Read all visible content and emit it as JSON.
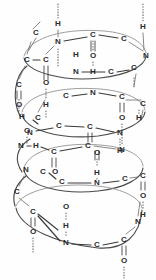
{
  "figure": {
    "kind": "molecular-structure-diagram",
    "background_color": "#fefefe",
    "ink_color": "#2b2b2b",
    "coil_color": "#4a4a4a",
    "hbond_color": "#5a5a5a",
    "turns": 3,
    "atom_labels": {
      "nitrogen": "N",
      "carbon": "C",
      "oxygen": "O",
      "hydrogen": "H"
    },
    "turn1": {
      "atoms": [
        {
          "id": "t1-c-ext",
          "label": "C",
          "x": 36,
          "y": 33
        },
        {
          "id": "t1-n1",
          "label": "N",
          "x": 58,
          "y": 42
        },
        {
          "id": "t1-h1",
          "label": "H",
          "x": 58,
          "y": 24
        },
        {
          "id": "t1-c1",
          "label": "C",
          "x": 93,
          "y": 35
        },
        {
          "id": "t1-c2",
          "label": "C",
          "x": 124,
          "y": 39
        },
        {
          "id": "t1-h2",
          "label": "H",
          "x": 143,
          "y": 27
        },
        {
          "id": "t1-n2",
          "label": "N",
          "x": 146,
          "y": 56
        },
        {
          "id": "t1-o1",
          "label": "O",
          "x": 93,
          "y": 56
        },
        {
          "id": "t1-h3",
          "label": "H",
          "x": 76,
          "y": 55
        },
        {
          "id": "t1-ca",
          "label": "C",
          "x": 27,
          "y": 60
        },
        {
          "id": "t1-cb",
          "label": "C",
          "x": 46,
          "y": 60
        },
        {
          "id": "t1-n3",
          "label": "N",
          "x": 76,
          "y": 72
        },
        {
          "id": "t1-h4",
          "label": "H",
          "x": 93,
          "y": 72
        },
        {
          "id": "t1-c3",
          "label": "C",
          "x": 111,
          "y": 72
        },
        {
          "id": "t1-c4",
          "label": "C",
          "x": 134,
          "y": 68
        }
      ]
    },
    "turn2": {
      "atoms": [
        {
          "id": "t2-c-ext",
          "label": "C",
          "x": 19,
          "y": 85
        },
        {
          "id": "t2-o-ext",
          "label": "O",
          "x": 19,
          "y": 105
        },
        {
          "id": "t2-o1",
          "label": "O",
          "x": 46,
          "y": 83
        },
        {
          "id": "t2-h1",
          "label": "H",
          "x": 46,
          "y": 105
        },
        {
          "id": "t2-c1",
          "label": "C",
          "x": 66,
          "y": 96
        },
        {
          "id": "t2-n1",
          "label": "N",
          "x": 93,
          "y": 93
        },
        {
          "id": "t2-c2",
          "label": "C",
          "x": 122,
          "y": 97
        },
        {
          "id": "t2-o2",
          "label": "O",
          "x": 122,
          "y": 118
        },
        {
          "id": "t2-h2",
          "label": "H",
          "x": 139,
          "y": 118
        },
        {
          "id": "t2-c3",
          "label": "C",
          "x": 143,
          "y": 104
        },
        {
          "id": "t2-ca",
          "label": "C",
          "x": 38,
          "y": 118
        },
        {
          "id": "t2-o3",
          "label": "O",
          "x": 27,
          "y": 131
        },
        {
          "id": "t2-h3",
          "label": "H",
          "x": 22,
          "y": 117
        },
        {
          "id": "t2-n2",
          "label": "N",
          "x": 30,
          "y": 133
        },
        {
          "id": "t2-c4",
          "label": "C",
          "x": 59,
          "y": 126
        },
        {
          "id": "t2-c5",
          "label": "C",
          "x": 90,
          "y": 127
        },
        {
          "id": "t2-n3",
          "label": "N",
          "x": 120,
          "y": 133
        },
        {
          "id": "t2-h4",
          "label": "H",
          "x": 120,
          "y": 151
        }
      ]
    },
    "turn3": {
      "atoms": [
        {
          "id": "t3-n1",
          "label": "N",
          "x": 21,
          "y": 146
        },
        {
          "id": "t3-h1",
          "label": "H",
          "x": 36,
          "y": 146
        },
        {
          "id": "t3-c1",
          "label": "C",
          "x": 54,
          "y": 152
        },
        {
          "id": "t3-c2",
          "label": "C",
          "x": 88,
          "y": 146
        },
        {
          "id": "t3-o1",
          "label": "O",
          "x": 97,
          "y": 153
        },
        {
          "id": "t3-n2",
          "label": "N",
          "x": 122,
          "y": 150
        },
        {
          "id": "t3-n3",
          "label": "N",
          "x": 26,
          "y": 170
        },
        {
          "id": "t3-c3",
          "label": "C",
          "x": 43,
          "y": 172
        },
        {
          "id": "t3-o2",
          "label": "O",
          "x": 55,
          "y": 172
        },
        {
          "id": "t3-h2",
          "label": "H",
          "x": 97,
          "y": 173
        },
        {
          "id": "t3-c4",
          "label": "C",
          "x": 62,
          "y": 182
        },
        {
          "id": "t3-n4",
          "label": "N",
          "x": 97,
          "y": 183
        },
        {
          "id": "t3-c5",
          "label": "C",
          "x": 125,
          "y": 179
        },
        {
          "id": "t3-c6",
          "label": "C",
          "x": 143,
          "y": 176
        },
        {
          "id": "t3-o3",
          "label": "O",
          "x": 143,
          "y": 196
        },
        {
          "id": "t3-h3",
          "label": "H",
          "x": 143,
          "y": 215
        },
        {
          "id": "t3-ca",
          "label": "C",
          "x": 17,
          "y": 192
        },
        {
          "id": "t3-c7",
          "label": "C",
          "x": 33,
          "y": 212
        },
        {
          "id": "t3-o4",
          "label": "O",
          "x": 33,
          "y": 232
        },
        {
          "id": "t3-o5",
          "label": "O",
          "x": 66,
          "y": 207
        },
        {
          "id": "t3-h4",
          "label": "H",
          "x": 66,
          "y": 226
        },
        {
          "id": "t3-n5",
          "label": "N",
          "x": 66,
          "y": 243
        },
        {
          "id": "t3-c8",
          "label": "C",
          "x": 97,
          "y": 245
        },
        {
          "id": "t3-c9",
          "label": "C",
          "x": 124,
          "y": 240
        },
        {
          "id": "t3-o6",
          "label": "O",
          "x": 124,
          "y": 261
        },
        {
          "id": "t3-n6",
          "label": "N",
          "x": 138,
          "y": 222
        }
      ]
    }
  }
}
